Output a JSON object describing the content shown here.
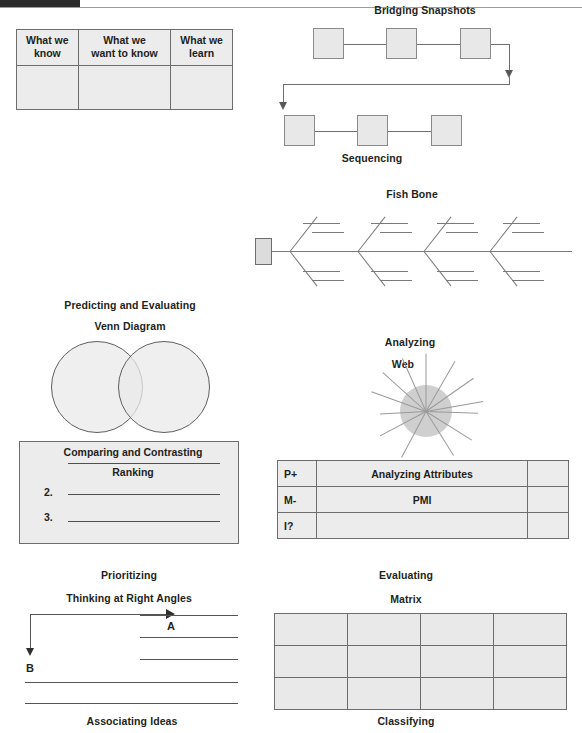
{
  "page": {
    "background_color": "#ffffff",
    "ink_color": "#231f20",
    "fill_color": "#e9e9e9",
    "stroke_color": "#6d6d6d"
  },
  "header": {
    "black_bar": "",
    "rule": ""
  },
  "kwl": {
    "headers": [
      "What we know",
      "What we want to know",
      "What we learn"
    ],
    "header_lines": [
      [
        "What we",
        "know"
      ],
      [
        "What we",
        "want to know"
      ],
      [
        "What we",
        "learn"
      ]
    ],
    "body_row": [
      "",
      "",
      ""
    ]
  },
  "bridging": {
    "title": "Bridging Snapshots",
    "caption": "Sequencing",
    "row1_boxes": [
      "",
      "",
      ""
    ],
    "row2_boxes": [
      "",
      "",
      ""
    ]
  },
  "fishbone": {
    "title": "Fish Bone",
    "head_label": "",
    "rib_count": 4
  },
  "venn": {
    "title": "Predicting and Evaluating",
    "subtitle": "Venn Diagram",
    "circle_labels": [
      "",
      ""
    ]
  },
  "web": {
    "title": "Analyzing",
    "subtitle": "Web",
    "spoke_count": 12,
    "center_label": ""
  },
  "ranking": {
    "top_label": "Comparing and Contrasting",
    "title": "Ranking",
    "items": [
      {
        "number": "",
        "value": ""
      },
      {
        "number": "2.",
        "value": ""
      },
      {
        "number": "3.",
        "value": ""
      }
    ],
    "caption": "Prioritizing"
  },
  "pmi": {
    "title": "Analyzing Attributes",
    "center_label": "PMI",
    "rows": [
      {
        "key": "P+",
        "mid": "Analyzing Attributes",
        "tail": ""
      },
      {
        "key": "M-",
        "mid": "PMI",
        "tail": ""
      },
      {
        "key": "I?",
        "mid": "",
        "tail": ""
      }
    ],
    "caption": "Evaluating"
  },
  "right_angles": {
    "title": "Thinking at Right Angles",
    "arrow_a_label": "A",
    "arrow_b_label": "B",
    "caption": "Associating Ideas",
    "short_line_count": 3,
    "long_line_count": 2
  },
  "matrix": {
    "title": "Matrix",
    "caption": "Classifying",
    "rows": 3,
    "cols": 4,
    "cells": [
      [
        "",
        "",
        "",
        ""
      ],
      [
        "",
        "",
        "",
        ""
      ],
      [
        "",
        "",
        "",
        ""
      ]
    ]
  }
}
